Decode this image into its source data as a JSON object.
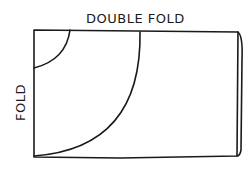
{
  "diagram": {
    "top_label": "DOUBLE FOLD",
    "side_label": "FOLD",
    "shapes": [
      {
        "name": "paper-rectangle",
        "description": "folded sheet, rectangle"
      },
      {
        "name": "small-quarter-circle",
        "description": "small arc cut from top-left corner"
      },
      {
        "name": "large-quarter-circle",
        "description": "large arc from top edge to bottom-left corner"
      }
    ],
    "colors": {
      "ink": "#1a1a1a",
      "background": "#ffffff"
    }
  }
}
